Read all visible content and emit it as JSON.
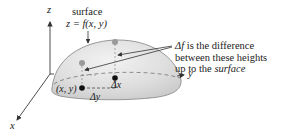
{
  "diagram": {
    "type": "3d-surface-illustration",
    "axes": {
      "z_label": "z",
      "y_label": "y",
      "x_label": "x"
    },
    "surface_label": {
      "line1": "surface",
      "line2": "z = f(x, y)"
    },
    "annotation": {
      "prefix": "Δf",
      "line1_rest": " is the difference",
      "line2": "between these heights",
      "line3_plain": "up to the ",
      "line3_italic": "surface"
    },
    "points": {
      "base_point_label": "(x, y)",
      "delta_x_label": "Δx",
      "delta_y_label": "Δy"
    },
    "colors": {
      "surface_fill": "#dcdcdc",
      "surface_edge": "#8c8c8c",
      "axis": "#3a3a3a",
      "gray_point": "#9a9a9a",
      "black_point": "#111111",
      "text": "#222222"
    }
  }
}
